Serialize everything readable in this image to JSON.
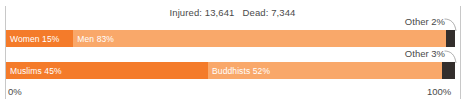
{
  "chart_data": {
    "type": "bar",
    "title": "Injured: 13,641   Dead: 7,344",
    "subtitle": "",
    "xlabel": "",
    "ylabel": "",
    "orientation": "horizontal",
    "stacked": true,
    "grid": false,
    "legend": "none",
    "xlim": [
      0,
      100
    ],
    "axis_ticks": [
      "0%",
      "100%"
    ],
    "categories": [
      "Gender",
      "Religion"
    ],
    "bars": [
      {
        "name": "gender",
        "segments": [
          {
            "label": "Women 15%",
            "value": 15,
            "color": "#F47B2A"
          },
          {
            "label": "Men 83%",
            "value": 83,
            "color": "#F9A86A"
          },
          {
            "label": "Other 2%",
            "value": 2,
            "color": "#332E2C",
            "callout": true
          }
        ]
      },
      {
        "name": "religion",
        "segments": [
          {
            "label": "Muslims 45%",
            "value": 45,
            "color": "#F47B2A"
          },
          {
            "label": "Buddhists 52%",
            "value": 52,
            "color": "#F9A86A"
          },
          {
            "label": "Other 3%",
            "value": 3,
            "color": "#332E2C",
            "callout": true
          }
        ]
      }
    ]
  },
  "title": "Injured: 13,641   Dead: 7,344",
  "axis": {
    "min_label": "0%",
    "max_label": "100%"
  },
  "bars": {
    "gender": {
      "women": {
        "label": "Women 15%",
        "value": 15,
        "color": "#F47B2A"
      },
      "men": {
        "label": "Men 83%",
        "value": 83,
        "color": "#F9A86A"
      },
      "other": {
        "label": "Other 2%",
        "value": 2,
        "color": "#332E2C"
      }
    },
    "religion": {
      "muslims": {
        "label": "Muslims 45%",
        "value": 45,
        "color": "#F47B2A"
      },
      "buddhists": {
        "label": "Buddhists 52%",
        "value": 52,
        "color": "#F9A86A"
      },
      "other": {
        "label": "Other 3%",
        "value": 3,
        "color": "#332E2C"
      }
    }
  },
  "colors": {
    "dark_orange": "#F47B2A",
    "light_orange": "#F9A86A",
    "other_dark": "#332E2C",
    "text": "#4a4a4a",
    "axis_line": "#c8c8c8",
    "background": "#ffffff"
  }
}
